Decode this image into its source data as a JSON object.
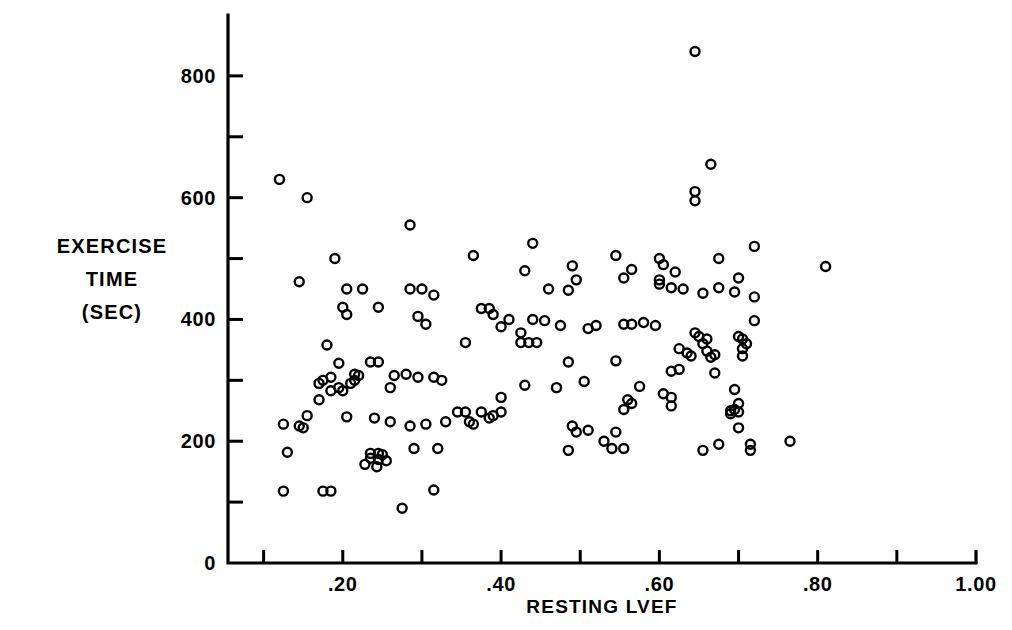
{
  "figure": {
    "background_color": "#fefefe",
    "ink_color": "#000000",
    "width": 1012,
    "height": 630
  },
  "axes": {
    "x": {
      "label": "RESTING LVEF",
      "major_ticks": [
        {
          "value": 0.2,
          "label": ".20"
        },
        {
          "value": 0.4,
          "label": ".40"
        },
        {
          "value": 0.6,
          "label": ".60"
        },
        {
          "value": 0.8,
          "label": ".80"
        },
        {
          "value": 1.0,
          "label": "1.00"
        }
      ],
      "minor_tick_values": [
        0.1,
        0.3,
        0.5,
        0.7,
        0.9
      ],
      "range": [
        0.055,
        1.0
      ]
    },
    "y": {
      "label_lines": [
        "EXERCISE",
        "TIME",
        "(SEC)"
      ],
      "major_ticks": [
        {
          "value": 0,
          "label": "0"
        },
        {
          "value": 200,
          "label": "200"
        },
        {
          "value": 400,
          "label": "400"
        },
        {
          "value": 600,
          "label": "600"
        },
        {
          "value": 800,
          "label": "800"
        }
      ],
      "minor_tick_values": [
        100,
        300,
        500,
        700
      ],
      "range": [
        0,
        900
      ]
    }
  },
  "chart_data": {
    "type": "scatter",
    "title": "",
    "xlabel": "RESTING LVEF",
    "ylabel": "EXERCISE TIME (SEC)",
    "xlim": [
      0.055,
      1.0
    ],
    "ylim": [
      0,
      900
    ],
    "grid": false,
    "legend": false,
    "marker": {
      "shape": "open-circle",
      "size_px": 9,
      "stroke_px": 2.4,
      "fill": "none",
      "color": "#000000"
    },
    "n_points": 163,
    "points": [
      [
        0.12,
        630
      ],
      [
        0.155,
        600
      ],
      [
        0.285,
        555
      ],
      [
        0.44,
        525
      ],
      [
        0.72,
        520
      ],
      [
        0.365,
        505
      ],
      [
        0.19,
        500
      ],
      [
        0.545,
        505
      ],
      [
        0.6,
        500
      ],
      [
        0.675,
        500
      ],
      [
        0.605,
        490
      ],
      [
        0.49,
        488
      ],
      [
        0.81,
        487
      ],
      [
        0.43,
        480
      ],
      [
        0.565,
        482
      ],
      [
        0.62,
        478
      ],
      [
        0.145,
        462
      ],
      [
        0.495,
        465
      ],
      [
        0.7,
        468
      ],
      [
        0.555,
        468
      ],
      [
        0.205,
        450
      ],
      [
        0.225,
        450
      ],
      [
        0.285,
        450
      ],
      [
        0.3,
        450
      ],
      [
        0.675,
        452
      ],
      [
        0.615,
        452
      ],
      [
        0.63,
        450
      ],
      [
        0.46,
        450
      ],
      [
        0.485,
        448
      ],
      [
        0.695,
        445
      ],
      [
        0.655,
        443
      ],
      [
        0.315,
        440
      ],
      [
        0.72,
        437
      ],
      [
        0.2,
        420
      ],
      [
        0.245,
        420
      ],
      [
        0.375,
        418
      ],
      [
        0.385,
        418
      ],
      [
        0.205,
        408
      ],
      [
        0.39,
        408
      ],
      [
        0.295,
        405
      ],
      [
        0.72,
        398
      ],
      [
        0.41,
        400
      ],
      [
        0.305,
        392
      ],
      [
        0.555,
        392
      ],
      [
        0.565,
        392
      ],
      [
        0.4,
        388
      ],
      [
        0.595,
        390
      ],
      [
        0.51,
        385
      ],
      [
        0.425,
        378
      ],
      [
        0.645,
        378
      ],
      [
        0.65,
        372
      ],
      [
        0.7,
        372
      ],
      [
        0.705,
        368
      ],
      [
        0.425,
        362
      ],
      [
        0.435,
        362
      ],
      [
        0.445,
        362
      ],
      [
        0.355,
        362
      ],
      [
        0.18,
        358
      ],
      [
        0.625,
        352
      ],
      [
        0.66,
        348
      ],
      [
        0.67,
        342
      ],
      [
        0.665,
        338
      ],
      [
        0.545,
        332
      ],
      [
        0.485,
        330
      ],
      [
        0.195,
        328
      ],
      [
        0.235,
        330
      ],
      [
        0.245,
        330
      ],
      [
        0.625,
        318
      ],
      [
        0.615,
        315
      ],
      [
        0.67,
        312
      ],
      [
        0.215,
        310
      ],
      [
        0.22,
        308
      ],
      [
        0.265,
        308
      ],
      [
        0.185,
        305
      ],
      [
        0.295,
        305
      ],
      [
        0.315,
        305
      ],
      [
        0.325,
        300
      ],
      [
        0.505,
        298
      ],
      [
        0.17,
        295
      ],
      [
        0.47,
        288
      ],
      [
        0.575,
        290
      ],
      [
        0.695,
        285
      ],
      [
        0.195,
        288
      ],
      [
        0.2,
        283
      ],
      [
        0.185,
        283
      ],
      [
        0.605,
        278
      ],
      [
        0.615,
        272
      ],
      [
        0.56,
        268
      ],
      [
        0.565,
        262
      ],
      [
        0.4,
        272
      ],
      [
        0.615,
        258
      ],
      [
        0.7,
        262
      ],
      [
        0.695,
        252
      ],
      [
        0.555,
        252
      ],
      [
        0.345,
        248
      ],
      [
        0.355,
        248
      ],
      [
        0.375,
        248
      ],
      [
        0.155,
        242
      ],
      [
        0.7,
        248
      ],
      [
        0.205,
        240
      ],
      [
        0.24,
        238
      ],
      [
        0.39,
        242
      ],
      [
        0.26,
        232
      ],
      [
        0.33,
        232
      ],
      [
        0.285,
        225
      ],
      [
        0.365,
        228
      ],
      [
        0.125,
        228
      ],
      [
        0.145,
        225
      ],
      [
        0.15,
        222
      ],
      [
        0.49,
        225
      ],
      [
        0.495,
        215
      ],
      [
        0.545,
        215
      ],
      [
        0.7,
        222
      ],
      [
        0.765,
        200
      ],
      [
        0.715,
        195
      ],
      [
        0.675,
        195
      ],
      [
        0.54,
        188
      ],
      [
        0.555,
        188
      ],
      [
        0.485,
        185
      ],
      [
        0.655,
        185
      ],
      [
        0.715,
        185
      ],
      [
        0.13,
        182
      ],
      [
        0.29,
        188
      ],
      [
        0.235,
        180
      ],
      [
        0.245,
        180
      ],
      [
        0.25,
        178
      ],
      [
        0.235,
        172
      ],
      [
        0.245,
        170
      ],
      [
        0.255,
        168
      ],
      [
        0.228,
        162
      ],
      [
        0.243,
        158
      ],
      [
        0.125,
        118
      ],
      [
        0.175,
        118
      ],
      [
        0.185,
        118
      ],
      [
        0.315,
        120
      ],
      [
        0.275,
        90
      ],
      [
        0.58,
        395
      ],
      [
        0.645,
        610
      ],
      [
        0.645,
        595
      ],
      [
        0.665,
        655
      ],
      [
        0.645,
        840
      ],
      [
        0.52,
        390
      ],
      [
        0.53,
        200
      ],
      [
        0.51,
        218
      ],
      [
        0.385,
        238
      ],
      [
        0.4,
        248
      ],
      [
        0.475,
        390
      ],
      [
        0.44,
        400
      ],
      [
        0.455,
        398
      ],
      [
        0.305,
        228
      ],
      [
        0.36,
        232
      ],
      [
        0.215,
        300
      ],
      [
        0.21,
        295
      ],
      [
        0.26,
        288
      ],
      [
        0.28,
        310
      ],
      [
        0.175,
        300
      ],
      [
        0.17,
        268
      ],
      [
        0.32,
        188
      ],
      [
        0.43,
        292
      ],
      [
        0.6,
        458
      ],
      [
        0.6,
        465
      ],
      [
        0.64,
        340
      ],
      [
        0.635,
        345
      ],
      [
        0.66,
        368
      ],
      [
        0.655,
        360
      ],
      [
        0.71,
        360
      ],
      [
        0.705,
        352
      ],
      [
        0.705,
        340
      ],
      [
        0.69,
        250
      ],
      [
        0.69,
        245
      ]
    ]
  }
}
